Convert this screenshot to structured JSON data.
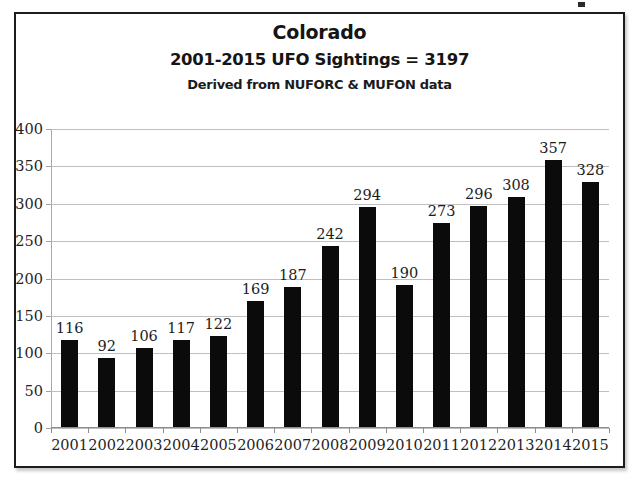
{
  "chart_data": {
    "type": "bar",
    "title": "Colorado",
    "subtitle": "2001-2015  UFO Sightings = 3197",
    "source_note": "Derived from NUFORC & MUFON data",
    "xlabel": "",
    "ylabel": "",
    "ylim": [
      0,
      400
    ],
    "ytick_labels": [
      "0",
      "50",
      "100",
      "150",
      "200",
      "250",
      "300",
      "350",
      "400"
    ],
    "ytick_values": [
      0,
      50,
      100,
      150,
      200,
      250,
      300,
      350,
      400
    ],
    "grid": true,
    "legend": "none",
    "bar_color": "#0b0b0b",
    "categories": [
      "2001",
      "2002",
      "2003",
      "2004",
      "2005",
      "2006",
      "2007",
      "2008",
      "2009",
      "2010",
      "2011",
      "2012",
      "2013",
      "2014",
      "2015"
    ],
    "values": [
      116,
      92,
      106,
      117,
      122,
      169,
      187,
      242,
      294,
      190,
      273,
      296,
      308,
      357,
      328
    ],
    "data_labels": [
      "116",
      "92",
      "106",
      "117",
      "122",
      "169",
      "187",
      "242",
      "294",
      "190",
      "273",
      "296",
      "308",
      "357",
      "328"
    ]
  },
  "frame": {
    "border_color": "#1c1c1c",
    "background": "#ffffff"
  }
}
